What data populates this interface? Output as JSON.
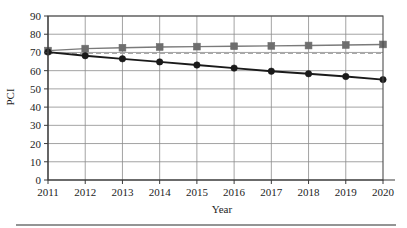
{
  "chart_data": {
    "type": "line",
    "title": "",
    "subtitle": "",
    "xlabel": "Year",
    "ylabel": "PCI",
    "x": [
      2011,
      2012,
      2013,
      2014,
      2015,
      2016,
      2017,
      2018,
      2019,
      2020
    ],
    "categories": [
      "2011",
      "2012",
      "2013",
      "2014",
      "2015",
      "2016",
      "2017",
      "2018",
      "2019",
      "2020"
    ],
    "xlim": [
      2011,
      2020
    ],
    "ylim": [
      0,
      90
    ],
    "y_ticks": [
      0,
      10,
      20,
      30,
      40,
      50,
      60,
      70,
      80,
      90
    ],
    "y_tick_labels": [
      "0",
      "10",
      "20",
      "30",
      "40",
      "50",
      "60",
      "70",
      "80",
      "90"
    ],
    "x_tick_labels": [
      "2011",
      "2012",
      "2013",
      "2014",
      "2015",
      "2016",
      "2017",
      "2018",
      "2019",
      "2020"
    ],
    "grid": "both",
    "legend": "none",
    "series": [
      {
        "name": "upper-square-series",
        "marker": "square",
        "linestyle": "solid",
        "color": "#7a7a7a",
        "marker_color": "#6e6e6e",
        "values": [
          71.0,
          72.1,
          72.6,
          73.0,
          73.2,
          73.4,
          73.6,
          73.8,
          74.1,
          74.4
        ]
      },
      {
        "name": "reference-dashed-series",
        "marker": "none",
        "linestyle": "dashed",
        "color": "#a8a8a8",
        "marker_color": "#a8a8a8",
        "values": [
          69.5,
          69.5,
          69.5,
          69.5,
          69.5,
          69.5,
          69.5,
          69.5,
          69.5,
          69.5
        ]
      },
      {
        "name": "lower-circle-series",
        "marker": "circle",
        "linestyle": "solid",
        "color": "#1a1a1a",
        "marker_color": "#1a1a1a",
        "values": [
          70.2,
          68.2,
          66.5,
          64.8,
          63.1,
          61.4,
          59.7,
          58.3,
          56.8,
          55.1
        ]
      }
    ]
  },
  "figure": {
    "bottom_rule_visible": "true"
  }
}
